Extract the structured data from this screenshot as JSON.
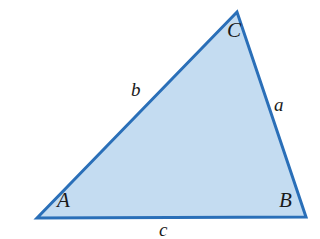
{
  "figure": {
    "name": "labeled-triangle-diagram",
    "background_color": "#ffffff",
    "width": 320,
    "height": 239,
    "stroke_color": "#2a6fb8",
    "fill_color": "#c4dcf1",
    "stroke_width": 3
  },
  "geometry": {
    "vertices": {
      "A": {
        "x": 37,
        "y": 218
      },
      "B": {
        "x": 306,
        "y": 217
      },
      "C": {
        "x": 237,
        "y": 12
      }
    },
    "polygon_points": "37,218 237,12 306,217"
  },
  "labels": {
    "vertex_a": "A",
    "vertex_b": "B",
    "vertex_c": "C",
    "side_a": "a",
    "side_b": "b",
    "side_c": "c"
  },
  "label_meaning": {
    "side_a": "side opposite vertex A (from B to C)",
    "side_b": "side opposite vertex B (from A to C)",
    "side_c": "side opposite vertex C (from A to B)"
  }
}
